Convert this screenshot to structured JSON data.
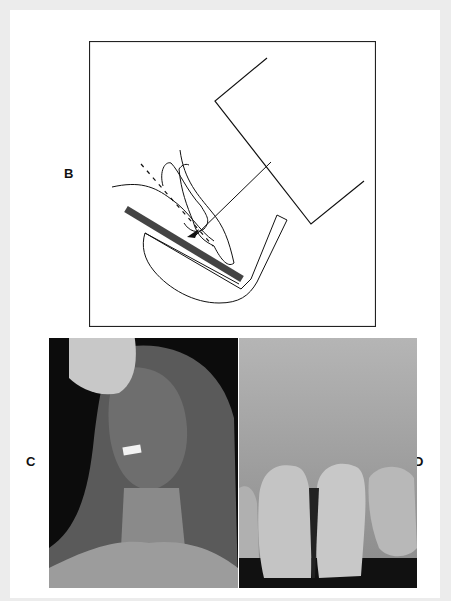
{
  "figure": {
    "panels": [
      {
        "id": "B",
        "label": "B",
        "type": "diagram",
        "description": "Schematic of paralleling technique: x-ray tube head with central ray directed perpendicular to tooth and receptor in holder"
      },
      {
        "id": "C",
        "label": "C",
        "type": "photo",
        "description": "Patient with receptor holder bitten between teeth and x-ray cone positioned at face"
      },
      {
        "id": "D",
        "label": "D",
        "type": "radiograph",
        "description": "Periapical radiograph of maxillary central incisors"
      }
    ]
  },
  "colors": {
    "background": "#ececec",
    "page": "#ffffff",
    "line": "#111111",
    "receptor": "#444444"
  }
}
